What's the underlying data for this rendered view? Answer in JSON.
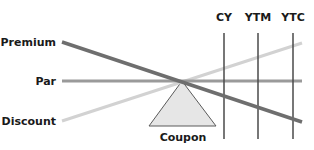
{
  "diagram": {
    "row_labels": {
      "premium": "Premium",
      "par": "Par",
      "discount": "Discount"
    },
    "column_labels": [
      "CY",
      "YTM",
      "YTC"
    ],
    "fulcrum_label": "Coupon",
    "colors": {
      "premium_line": "#6e6e6e",
      "par_line": "#9a9a9a",
      "discount_line": "#d2d2d2",
      "vertical_lines": "#4a4a4a",
      "triangle_fill": "#e6e6e6",
      "triangle_stroke": "#5a5a5a",
      "text": "#1a1a1a"
    }
  }
}
